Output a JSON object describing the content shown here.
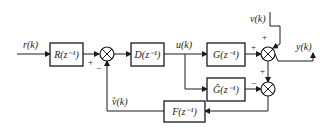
{
  "diagram": {
    "type": "block-diagram",
    "signals": {
      "input": "r(k)",
      "control": "u(k)",
      "disturbance": "v(k)",
      "output": "y(k)",
      "disturbance_estimate": "v̂(k)"
    },
    "blocks": {
      "R": "R(z⁻¹)",
      "D": "D(z⁻¹)",
      "G": "G(z⁻¹)",
      "Ghat": "Ĝ(z⁻¹)",
      "F": "F(z⁻¹)"
    },
    "signs": {
      "sum1_in": "+",
      "sum1_fb": "−",
      "sum2_g": "+",
      "sum2_v": "+",
      "sum3_y": "+",
      "sum3_ghat": "−"
    }
  }
}
